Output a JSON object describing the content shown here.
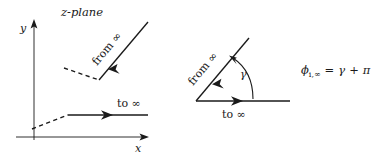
{
  "figure": {
    "background_color": "#ffffff",
    "ink_color": "#1a1a1a",
    "left_panel": {
      "title": "z-plane",
      "axes": {
        "x_label": "x",
        "y_label": "y",
        "x_axis_name": "horizontal-axis",
        "y_axis_name": "vertical-axis"
      },
      "paths": [
        {
          "name": "upper-contour",
          "label": "from ∞",
          "style": "solid-with-arrow",
          "direction": "incoming",
          "angle_deg": 50
        },
        {
          "name": "lower-contour",
          "label": "to ∞",
          "style": "solid-with-arrow",
          "direction": "outgoing",
          "angle_deg": 0
        }
      ],
      "dashed_segments": [
        {
          "name": "upper-dashed-tail"
        },
        {
          "name": "lower-dashed-tail"
        }
      ]
    },
    "middle_panel": {
      "name": "angle-diagram",
      "incoming_ray_label": "from ∞",
      "outgoing_ray_label": "to ∞",
      "angle_label": "γ",
      "angle_deg": 50,
      "arc_name": "gamma-arc"
    },
    "right_panel": {
      "name": "phase-relation",
      "equation": {
        "symbol": "ϕ",
        "subscript": "i,∞",
        "relation": "=",
        "rhs_first": "γ",
        "operator": "+",
        "rhs_second": "π",
        "full": "ϕ i,∞ = γ + π"
      }
    }
  }
}
